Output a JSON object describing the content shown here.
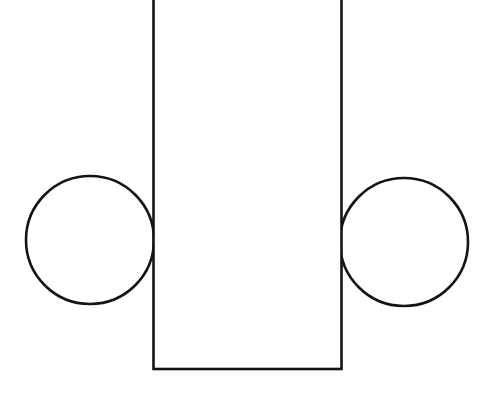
{
  "document": {
    "title": "Geometric Figure",
    "background_color": "#ffffff",
    "width": 480,
    "height": 396,
    "description": "Line drawing of a tall vertical rectangle flanked by two circles tangent to its left and right sides"
  },
  "style": {
    "stroke_color": "#141414",
    "stroke_width": 2.6,
    "fill_color": "#ffffff",
    "fill": "none"
  },
  "shapes": [
    {
      "name": "vertical-rectangle",
      "type": "rect",
      "label": "Rectangle",
      "x": 153.5,
      "y": -40,
      "width": 188,
      "height": 409,
      "left": 153.5,
      "right": 341.5,
      "bottom": 369,
      "top_cropped": true,
      "stroke_color": "#141414",
      "stroke_width": 2.6,
      "fill_color": "#ffffff"
    },
    {
      "name": "left-circle",
      "type": "circle",
      "label": "Left circle",
      "cx": 90,
      "cy": 240,
      "r": 64,
      "diameter": 128,
      "tangent_to": "vertical-rectangle-left-edge",
      "stroke_color": "#141414",
      "stroke_width": 2.6,
      "fill": "none"
    },
    {
      "name": "right-circle",
      "type": "circle",
      "label": "Right circle",
      "cx": 404,
      "cy": 242,
      "r": 64,
      "diameter": 128,
      "tangent_to": "vertical-rectangle-right-edge",
      "stroke_color": "#141414",
      "stroke_width": 2.6,
      "fill": "none"
    }
  ]
}
